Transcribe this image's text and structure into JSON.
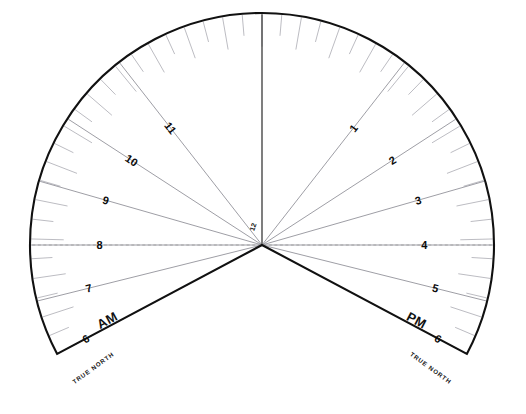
{
  "figure": {
    "background_color": "#ffffff",
    "outline_color": "#111111",
    "hour_line_color": "#8d8d95",
    "tick_color": "#a6a6ad",
    "noon_line_color": "#3a3a3a",
    "horizon_line_color": "#9b9b9b"
  },
  "geometry": {
    "center_x": 262,
    "center_y": 245,
    "outer_radius": 232,
    "arc_start_angle_deg": -118,
    "arc_end_angle_deg": 118,
    "tick_inner_fraction": 0.86,
    "hour_line_inner_fraction": 0.0
  },
  "center": {
    "label": "12"
  },
  "north": {
    "left_label": "TRUE NORTH",
    "right_label": "TRUE NORTH",
    "left_angle_deg": -104,
    "right_angle_deg": 104
  },
  "meridiem": {
    "am_label": "AM",
    "pm_label": "PM"
  },
  "hours": {
    "am": [
      {
        "label": "6",
        "angle_deg": -118,
        "radius_fraction": 0.86,
        "rotate": -28
      },
      {
        "label": "7",
        "angle_deg": -104,
        "radius_fraction": 0.77,
        "rotate": -14
      },
      {
        "label": "8",
        "angle_deg": -90,
        "radius_fraction": 0.7,
        "rotate": 0
      },
      {
        "label": "9",
        "angle_deg": -74,
        "radius_fraction": 0.7,
        "rotate": 16
      },
      {
        "label": "10",
        "angle_deg": -57,
        "radius_fraction": 0.67,
        "rotate": 33
      },
      {
        "label": "11",
        "angle_deg": -38,
        "radius_fraction": 0.64,
        "rotate": 52
      }
    ],
    "pm": [
      {
        "label": "1",
        "angle_deg": 38,
        "radius_fraction": 0.64,
        "rotate": -52
      },
      {
        "label": "2",
        "angle_deg": 57,
        "radius_fraction": 0.67,
        "rotate": -33
      },
      {
        "label": "3",
        "angle_deg": 74,
        "radius_fraction": 0.7,
        "rotate": -16
      },
      {
        "label": "4",
        "angle_deg": 90,
        "radius_fraction": 0.7,
        "rotate": 0
      },
      {
        "label": "5",
        "angle_deg": 104,
        "radius_fraction": 0.77,
        "rotate": 14
      },
      {
        "label": "6",
        "angle_deg": 118,
        "radius_fraction": 0.86,
        "rotate": 28
      }
    ]
  },
  "hour_lines": {
    "angles_deg": [
      -118,
      -104,
      -90,
      -74,
      -57,
      -38,
      0,
      38,
      57,
      74,
      90,
      104,
      118
    ]
  },
  "minor_ticks": {
    "count_per_side": 24,
    "span_deg": 118
  }
}
